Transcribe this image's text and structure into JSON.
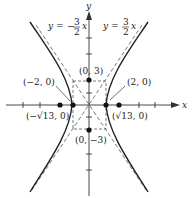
{
  "figure": {
    "type": "hyperbola-graph",
    "equation": "x^2/4 - y^2/9 = 1",
    "axes": {
      "x_label": "x",
      "y_label": "y"
    },
    "asymptotes": [
      {
        "label_lhs": "y =",
        "sign": "−",
        "num": "3",
        "den": "2",
        "var": "x",
        "slope": -1.5
      },
      {
        "label_lhs": "y =",
        "sign": "",
        "num": "3",
        "den": "2",
        "var": "x",
        "slope": 1.5
      }
    ],
    "points": [
      {
        "name": "vertex-left",
        "label": "(−2, 0)",
        "x": -2,
        "y": 0
      },
      {
        "name": "vertex-right",
        "label": "(2, 0)",
        "x": 2,
        "y": 0
      },
      {
        "name": "focus-left",
        "label": "(−√13, 0)",
        "x": -3.606,
        "y": 0
      },
      {
        "name": "focus-right",
        "label": "(√13, 0)",
        "x": 3.606,
        "y": 0
      },
      {
        "name": "covertex-top",
        "label": "(0, 3)",
        "x": 0,
        "y": 3
      },
      {
        "name": "covertex-bottom",
        "label": "(0, −3)",
        "x": 0,
        "y": -3
      }
    ],
    "colors": {
      "curve": "#222222",
      "asymptote": "#555555",
      "axis": "#333333",
      "point": "#111111"
    }
  }
}
